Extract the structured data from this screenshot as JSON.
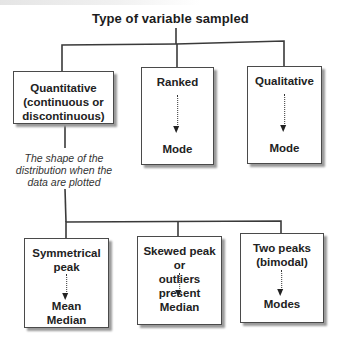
{
  "title": "Type of variable sampled",
  "top_level": [
    {
      "id": "quantitative",
      "label": "Quantitative (continuous or discontinuous)",
      "label_lines": [
        "Quantitative",
        "(continuous or",
        "discontinuous)"
      ]
    },
    {
      "id": "ranked",
      "label": "Ranked",
      "result": "Mode"
    },
    {
      "id": "qualitative",
      "label": "Qualitative",
      "result": "Mode"
    }
  ],
  "connector_note": {
    "lines": [
      "The shape of the",
      "distribution when the",
      "data are plotted"
    ]
  },
  "distribution_shapes": [
    {
      "id": "symmetrical",
      "label_lines": [
        "Symmetrical",
        "peak"
      ],
      "result_lines": [
        "Mean",
        "Median"
      ]
    },
    {
      "id": "skewed",
      "label_lines": [
        "Skewed peak or",
        "outliers present"
      ],
      "result_lines": [
        "Median"
      ]
    },
    {
      "id": "bimodal",
      "label_lines": [
        "Two peaks",
        "(bimodal)"
      ],
      "result_lines": [
        "Modes"
      ]
    }
  ],
  "colors": {
    "line": "#3a3a3a",
    "box_border": "#4a4a4a",
    "shadow": "#9a9a9a",
    "background": "#ffffff"
  }
}
